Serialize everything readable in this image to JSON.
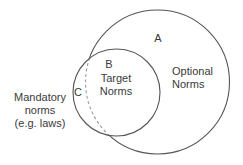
{
  "diagram": {
    "type": "venn",
    "colors": {
      "stroke": "#555555",
      "dashed_stroke": "#9a9a9a",
      "text": "#3a3a3a",
      "background": "#ffffff"
    },
    "sets": [
      {
        "id": "A",
        "letter": "A",
        "label_lines": [
          "Optional",
          "Norms"
        ],
        "circle": {
          "cx": 157.5,
          "cy": 82,
          "r": 72
        }
      },
      {
        "id": "B",
        "letter": "B",
        "label_lines": [
          "Target",
          "Norms"
        ],
        "circle": {
          "cx": 116.5,
          "cy": 92.5,
          "r": 43.5
        }
      }
    ],
    "regions": [
      {
        "id": "C",
        "letter": "C",
        "description": "part of B outside A"
      }
    ],
    "external_label": {
      "lines": [
        "Mandatory",
        "norms",
        "(e.g. laws)"
      ]
    }
  }
}
